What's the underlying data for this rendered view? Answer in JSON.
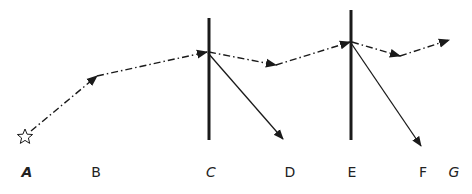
{
  "diagram": {
    "labels": [
      {
        "text": "A",
        "x": 27,
        "italic": true,
        "bold": true
      },
      {
        "text": "B",
        "x": 96,
        "italic": false
      },
      {
        "text": "C",
        "x": 211,
        "italic": true
      },
      {
        "text": "D",
        "x": 290,
        "italic": false
      },
      {
        "text": "E",
        "x": 352,
        "italic": false
      },
      {
        "text": "F",
        "x": 423,
        "italic": false
      },
      {
        "text": "G",
        "x": 454,
        "italic": true
      }
    ],
    "start_marker": "star-icon",
    "barriers": [
      {
        "name": "C",
        "x": 209,
        "y1": 18,
        "y2": 140
      },
      {
        "name": "E",
        "x": 351,
        "y1": 10,
        "y2": 140
      }
    ],
    "dashdot_path": [
      [
        25,
        136
      ],
      [
        97,
        76
      ],
      [
        207,
        52
      ],
      [
        276,
        65
      ],
      [
        350,
        42
      ],
      [
        400,
        56
      ],
      [
        449,
        40
      ]
    ],
    "solid_arrows": [
      {
        "from": [
          208,
          53
        ],
        "to": [
          283,
          139
        ]
      },
      {
        "from": [
          351,
          43
        ],
        "to": [
          421,
          146
        ]
      }
    ],
    "colors": {
      "stroke": "#1a1a1a",
      "background": "#ffffff"
    }
  }
}
